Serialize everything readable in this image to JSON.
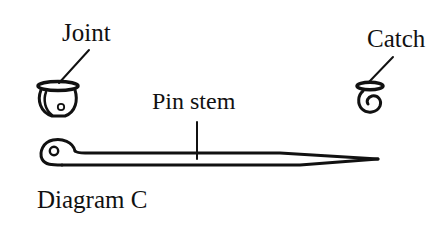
{
  "diagram": {
    "caption": "Diagram C",
    "stroke_color": "#111111",
    "background_color": "#ffffff",
    "parts": [
      {
        "id": "joint",
        "label": "Joint"
      },
      {
        "id": "catch",
        "label": "Catch"
      },
      {
        "id": "pin_stem",
        "label": "Pin stem"
      }
    ]
  },
  "labels": {
    "joint": "Joint",
    "catch": "Catch",
    "pin_stem": "Pin stem",
    "caption": "Diagram C"
  }
}
